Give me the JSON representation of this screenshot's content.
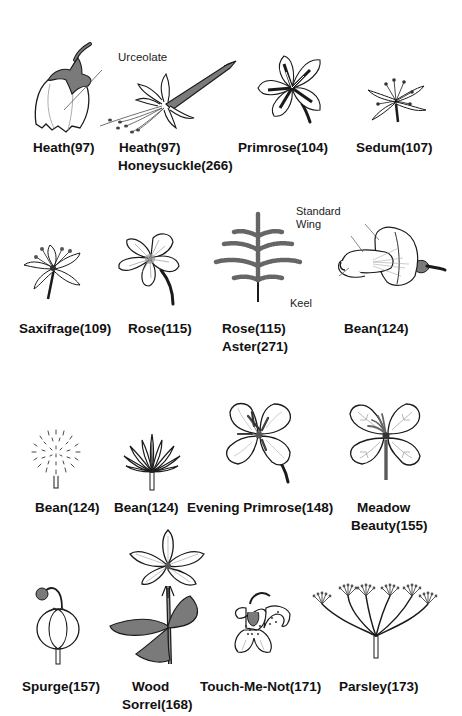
{
  "figure": {
    "rows": [
      {
        "items": [
          {
            "id": "heath-urceolate",
            "label_lines": [
              "Heath(97)"
            ],
            "annotation": "Urceolate"
          },
          {
            "id": "heath-honeysuckle",
            "label_lines": [
              "Heath(97)",
              "Honeysuckle(266)"
            ]
          },
          {
            "id": "primrose",
            "label_lines": [
              "Primrose(104)"
            ]
          },
          {
            "id": "sedum",
            "label_lines": [
              "Sedum(107)"
            ]
          }
        ]
      },
      {
        "items": [
          {
            "id": "saxifrage",
            "label_lines": [
              "Saxifrage(109)"
            ]
          },
          {
            "id": "rose",
            "label_lines": [
              "Rose(115)"
            ]
          },
          {
            "id": "rose-aster",
            "label_lines": [
              "Rose(115)",
              "Aster(271)"
            ]
          },
          {
            "id": "bean-papilionaceous",
            "label_lines": [
              "Bean(124)"
            ],
            "annotations": [
              "Standard",
              "Wing",
              "Keel"
            ]
          }
        ]
      },
      {
        "items": [
          {
            "id": "bean-head",
            "label_lines": [
              "Bean(124)"
            ]
          },
          {
            "id": "bean-mimosa",
            "label_lines": [
              "Bean(124)"
            ]
          },
          {
            "id": "evening-primrose",
            "label_lines": [
              "Evening Primrose(148)"
            ]
          },
          {
            "id": "meadow-beauty",
            "label_lines": [
              "Meadow",
              "Beauty(155)"
            ]
          }
        ]
      },
      {
        "items": [
          {
            "id": "spurge",
            "label_lines": [
              "Spurge(157)"
            ]
          },
          {
            "id": "wood-sorrel",
            "label_lines": [
              "Wood",
              "Sorrel(168)"
            ]
          },
          {
            "id": "touch-me-not",
            "label_lines": [
              "Touch-Me-Not(171)"
            ]
          },
          {
            "id": "parsley",
            "label_lines": [
              "Parsley(173)"
            ]
          }
        ]
      }
    ]
  },
  "colors": {
    "ink": "#1a1a1a",
    "shade": "#7a7a7a",
    "light_shade": "#b5b5b5",
    "background": "#ffffff"
  }
}
